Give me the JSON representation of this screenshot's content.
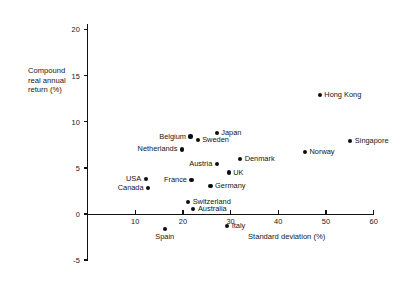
{
  "chart_data": {
    "type": "scatter",
    "title": "",
    "xlabel": "Standard deviation (%)",
    "ylabel": "Compound real annual return (%)",
    "ylabel_lines": [
      "Compound",
      "real annual",
      "return (%)"
    ],
    "xlim": [
      0,
      60
    ],
    "ylim": [
      -5,
      20
    ],
    "xticks": [
      10,
      20,
      30,
      40,
      50,
      60
    ],
    "xtick_labels": [
      "10",
      "20",
      "30",
      "40",
      "50",
      "60"
    ],
    "yticks": [
      -5,
      0,
      5,
      10,
      15,
      20
    ],
    "ytick_labels": [
      "-5",
      "0",
      "5",
      "10",
      "15",
      "20"
    ],
    "grid": false,
    "legend": false,
    "points": [
      {
        "name": "Hong Kong",
        "x": 48.7,
        "y": 12.9,
        "label_pos": "right"
      },
      {
        "name": "Singapore",
        "x": 55.1,
        "y": 7.9,
        "label_pos": "right"
      },
      {
        "name": "Norway",
        "x": 45.6,
        "y": 6.7,
        "label_pos": "right"
      },
      {
        "name": "Japan",
        "x": 27.1,
        "y": 8.8,
        "label_pos": "right"
      },
      {
        "name": "Belgium",
        "x": 21.6,
        "y": 8.4,
        "label_pos": "left"
      },
      {
        "name": "Sweden",
        "x": 23.1,
        "y": 8.0,
        "label_pos": "right"
      },
      {
        "name": "Netherlands",
        "x": 19.8,
        "y": 7.0,
        "label_pos": "left"
      },
      {
        "name": "Denmark",
        "x": 32.0,
        "y": 6.0,
        "label_pos": "right"
      },
      {
        "name": "Austria",
        "x": 27.1,
        "y": 5.4,
        "label_pos": "left"
      },
      {
        "name": "UK",
        "x": 29.6,
        "y": 4.5,
        "label_pos": "right"
      },
      {
        "name": "France",
        "x": 21.8,
        "y": 3.7,
        "label_pos": "left"
      },
      {
        "name": "USA",
        "x": 12.2,
        "y": 3.8,
        "label_pos": "left"
      },
      {
        "name": "Canada",
        "x": 12.7,
        "y": 2.8,
        "label_pos": "left"
      },
      {
        "name": "Germany",
        "x": 25.8,
        "y": 3.0,
        "label_pos": "right"
      },
      {
        "name": "Switzerland",
        "x": 21.1,
        "y": 1.3,
        "label_pos": "right"
      },
      {
        "name": "Australia",
        "x": 22.2,
        "y": 0.5,
        "label_pos": "right"
      },
      {
        "name": "Italy",
        "x": 29.3,
        "y": -1.3,
        "label_pos": "right"
      },
      {
        "name": "Spain",
        "x": 16.2,
        "y": -1.6,
        "label_pos": "below"
      }
    ]
  },
  "colors": {
    "background": "#ffffff",
    "axis": "#111111",
    "marker": "#0d0d0d",
    "text": "#141414"
  }
}
